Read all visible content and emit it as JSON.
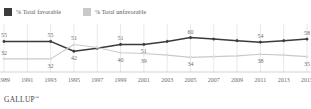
{
  "legend": {
    "items": [
      {
        "label": "% Total favorable",
        "icon": "square-swatch-icon",
        "color": "#3b3b3d"
      },
      {
        "label": "% Total unfavorable",
        "icon": "square-swatch-icon",
        "color": "#c8c9cb"
      }
    ]
  },
  "footer": {
    "brand": "GALLUP",
    "trademark": "™"
  },
  "chart_data": {
    "type": "line",
    "title": "",
    "subtitle": "",
    "xlabel": "",
    "ylabel": "",
    "grid": true,
    "legend_position": "top-left",
    "ylim": [
      20,
      70
    ],
    "xlim": [
      1989,
      2015
    ],
    "x": [
      1989,
      1993,
      1995,
      1997,
      1999,
      2001,
      2003,
      2005,
      2007,
      2009,
      2011,
      2013,
      2015
    ],
    "tick_labels": [
      "1989",
      "1991",
      "1993",
      "1995",
      "1997",
      "1999",
      "2001",
      "2003",
      "2005",
      "2007",
      "2009",
      "2011",
      "2013",
      "2015"
    ],
    "series": [
      {
        "name": "% Total favorable",
        "color": "#3b3b3d",
        "values": [
          55,
          55,
          42,
          46,
          51,
          51,
          55,
          60,
          58,
          56,
          54,
          56,
          58
        ],
        "labels": [
          {
            "x": 1989,
            "value": "55",
            "pos": "above"
          },
          {
            "x": 1993,
            "value": "55",
            "pos": "above"
          },
          {
            "x": 1995,
            "value": "42",
            "pos": "below"
          },
          {
            "x": 1999,
            "value": "51",
            "pos": "above"
          },
          {
            "x": 2001,
            "value": "51",
            "pos": "below"
          },
          {
            "x": 2005,
            "value": "60",
            "pos": "above"
          },
          {
            "x": 2011,
            "value": "54",
            "pos": "above"
          },
          {
            "x": 2015,
            "value": "58",
            "pos": "above"
          }
        ]
      },
      {
        "name": "% Total unfavorable",
        "color": "#c8c9cb",
        "values": [
          32,
          32,
          51,
          47,
          40,
          39,
          37,
          34,
          35,
          36,
          38,
          37,
          35
        ],
        "labels": [
          {
            "x": 1989,
            "value": "32",
            "pos": "above"
          },
          {
            "x": 1993,
            "value": "32",
            "pos": "below"
          },
          {
            "x": 1995,
            "value": "51",
            "pos": "above"
          },
          {
            "x": 1999,
            "value": "40",
            "pos": "below"
          },
          {
            "x": 2001,
            "value": "39",
            "pos": "below"
          },
          {
            "x": 2005,
            "value": "34",
            "pos": "below"
          },
          {
            "x": 2011,
            "value": "38",
            "pos": "below"
          },
          {
            "x": 2015,
            "value": "35",
            "pos": "below"
          }
        ]
      }
    ]
  }
}
